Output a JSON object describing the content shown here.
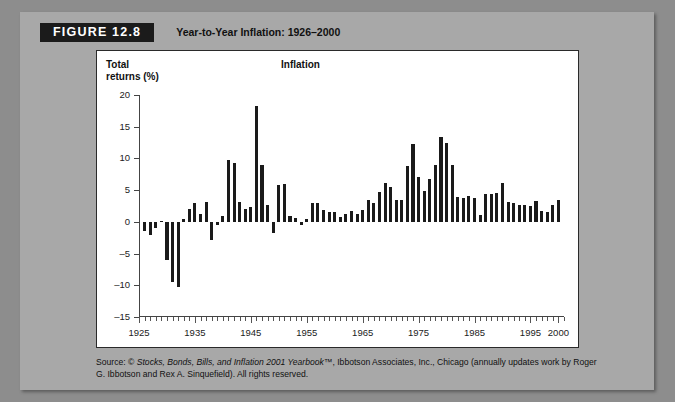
{
  "figure": {
    "badge": "FIGURE 12.8",
    "title": "Year-to-Year Inflation: 1926–2000"
  },
  "panel": {
    "y_axis_caption_line1": "Total",
    "y_axis_caption_line2": "returns (%)",
    "series_label": "Inflation"
  },
  "source": {
    "prefix": "Source: © ",
    "italic": "Stocks, Bonds, Bills, and Inflation 2001 Yearbook™",
    "suffix": ", Ibbotson Associates, Inc., Chicago (annually updates work by Roger G. Ibbotson and Rex A. Sinquefield). All rights reserved."
  },
  "chart_data": {
    "type": "bar",
    "title": "Inflation",
    "subtitle": "Year-to-Year Inflation: 1926–2000",
    "xlabel": "",
    "ylabel": "Total returns (%)",
    "ylim": [
      -15,
      20
    ],
    "xlim": [
      1925,
      2001
    ],
    "yticks": [
      -15,
      -10,
      -5,
      0,
      5,
      10,
      15,
      20
    ],
    "xticks": [
      1925,
      1935,
      1945,
      1955,
      1965,
      1975,
      1985,
      1995,
      2000
    ],
    "xtick_labels": [
      "1925",
      "1935",
      "1945",
      "1955",
      "1965",
      "1975",
      "1985",
      "1995",
      "2000"
    ],
    "grid": false,
    "legend": null,
    "bar_color": "#1a1a1a",
    "categories": [
      1926,
      1927,
      1928,
      1929,
      1930,
      1931,
      1932,
      1933,
      1934,
      1935,
      1936,
      1937,
      1938,
      1939,
      1940,
      1941,
      1942,
      1943,
      1944,
      1945,
      1946,
      1947,
      1948,
      1949,
      1950,
      1951,
      1952,
      1953,
      1954,
      1955,
      1956,
      1957,
      1958,
      1959,
      1960,
      1961,
      1962,
      1963,
      1964,
      1965,
      1966,
      1967,
      1968,
      1969,
      1970,
      1971,
      1972,
      1973,
      1974,
      1975,
      1976,
      1977,
      1978,
      1979,
      1980,
      1981,
      1982,
      1983,
      1984,
      1985,
      1986,
      1987,
      1988,
      1989,
      1990,
      1991,
      1992,
      1993,
      1994,
      1995,
      1996,
      1997,
      1998,
      1999,
      2000
    ],
    "values": [
      -1.5,
      -2.1,
      -1.0,
      0.2,
      -6.0,
      -9.5,
      -10.3,
      0.5,
      2.0,
      3.0,
      1.2,
      3.1,
      -2.8,
      -0.5,
      1.0,
      9.7,
      9.3,
      3.2,
      2.1,
      2.3,
      18.2,
      9.0,
      2.7,
      -1.8,
      5.8,
      5.9,
      0.9,
      0.6,
      -0.5,
      0.4,
      2.9,
      3.0,
      1.8,
      1.5,
      1.5,
      0.7,
      1.2,
      1.7,
      1.2,
      1.9,
      3.4,
      3.0,
      4.7,
      6.1,
      5.5,
      3.4,
      3.4,
      8.8,
      12.2,
      7.0,
      4.8,
      6.8,
      9.0,
      13.3,
      12.4,
      8.9,
      3.9,
      3.8,
      4.0,
      3.8,
      1.1,
      4.4,
      4.4,
      4.6,
      6.1,
      3.1,
      2.9,
      2.7,
      2.7,
      2.5,
      3.3,
      1.7,
      1.6,
      2.7,
      3.4
    ]
  }
}
